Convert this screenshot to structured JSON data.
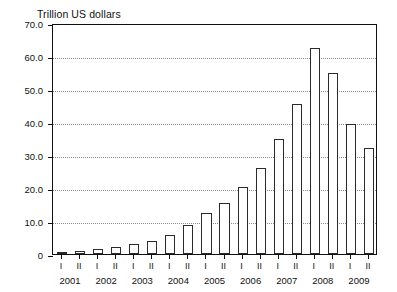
{
  "chart_data": {
    "type": "bar",
    "title": "Trillion US dollars",
    "ylabel": "Trillion US dollars",
    "xlabel": "",
    "ylim": [
      0,
      70
    ],
    "ytick_labels": [
      "70.0",
      "60.0",
      "50.0",
      "40.0",
      "30.0",
      "20.0",
      "10.0",
      "0"
    ],
    "ytick_values": [
      70,
      60,
      50,
      40,
      30,
      20,
      10,
      0
    ],
    "grid": true,
    "grid_axis": "y",
    "legend": false,
    "categories": [
      "2001 I",
      "2001 II",
      "2002 I",
      "2002 II",
      "2003 I",
      "2003 II",
      "2004 I",
      "2004 II",
      "2005 I",
      "2005 II",
      "2006 I",
      "2006 II",
      "2007 I",
      "2007 II",
      "2008 I",
      "2008 II",
      "2009 I",
      "2009 II"
    ],
    "values": [
      0.5,
      0.9,
      1.6,
      2.2,
      2.9,
      4.0,
      5.8,
      8.8,
      12.5,
      15.5,
      20.3,
      26.0,
      35.0,
      45.5,
      62.5,
      55.0,
      39.5,
      32.0
    ],
    "years": [
      "2001",
      "2002",
      "2003",
      "2004",
      "2005",
      "2006",
      "2007",
      "2008",
      "2009"
    ],
    "semesters": [
      "I",
      "II"
    ],
    "bar_facecolor": "#ffffff",
    "bar_edgecolor": "#2b2b2b",
    "axis_color": "#111111",
    "grid_color": "#8c8c8c"
  }
}
